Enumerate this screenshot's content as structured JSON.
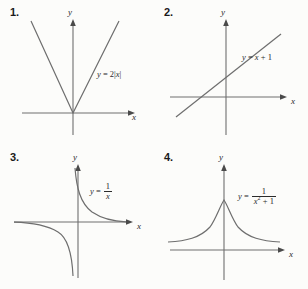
{
  "page": {
    "background_color": "#fcfcfa",
    "curve_color": "#6e6e6e",
    "axis_color": "#6e6e6e",
    "text_color": "#2b2b2b"
  },
  "axis_labels": {
    "x": "x",
    "y": "y"
  },
  "panels": [
    {
      "number": "1.",
      "equation_plain": "y = 2|x|",
      "equation_parts": {
        "lhs": "y",
        "eq": "=",
        "coefficient": "2",
        "abs_open": "|",
        "variable": "x",
        "abs_close": "|"
      },
      "graph_type": "absolute-value-v-shape",
      "description": "V-shaped graph with vertex at origin, opening upward"
    },
    {
      "number": "2.",
      "equation_plain": "y = x + 1",
      "equation_parts": {
        "lhs": "y",
        "eq": "=",
        "variable": "x",
        "plus": "+",
        "constant": "1"
      },
      "graph_type": "straight-line",
      "description": "Line with slope 1 crossing y-axis above origin"
    },
    {
      "number": "3.",
      "equation_plain": "y = 1/x",
      "equation_parts": {
        "lhs": "y",
        "eq": "=",
        "numerator": "1",
        "denominator": "x"
      },
      "graph_type": "hyperbola",
      "description": "Hyperbola with branches in quadrants I and III"
    },
    {
      "number": "4.",
      "equation_plain": "y = 1/(x^2 + 1)",
      "equation_parts": {
        "lhs": "y",
        "eq": "=",
        "numerator": "1",
        "denominator_base": "x",
        "denominator_exponent": "2",
        "denominator_plus": "+",
        "denominator_constant": "1"
      },
      "graph_type": "bell-curve",
      "description": "Bell-shaped curve peaking on the y-axis, approaching x-axis"
    }
  ]
}
